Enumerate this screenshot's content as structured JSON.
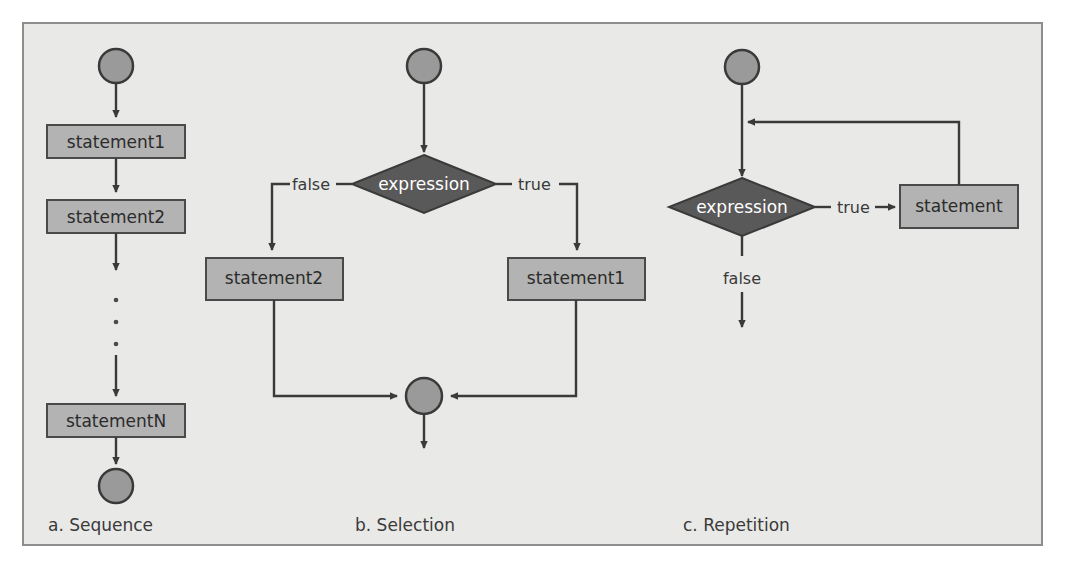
{
  "figure": {
    "background_color": "#e9e9e7",
    "border_color": "#8d8d8d",
    "box_fill": "#b3b3b3",
    "decision_fill": "#595959",
    "circle_fill": "#9a9a9a",
    "line_color": "#3a3a3a",
    "text_color": "#2b2b2b",
    "decision_text_color": "#ffffff"
  },
  "panels": [
    {
      "id": "sequence",
      "caption": "a.  Sequence",
      "nodes": {
        "start": "start-node",
        "statement1": "statement1",
        "statement2": "statement2",
        "ellipsis": "⋮",
        "statementN": "statementN",
        "end": "end-node"
      }
    },
    {
      "id": "selection",
      "caption": "b.  Selection",
      "nodes": {
        "start": "start-node",
        "decision": "expression",
        "false_label": "false",
        "true_label": "true",
        "false_branch": "statement2",
        "true_branch": "statement1",
        "merge": "merge-node"
      }
    },
    {
      "id": "repetition",
      "caption": "c.  Repetition",
      "nodes": {
        "start": "start-node",
        "decision": "expression",
        "true_label": "true",
        "false_label": "false",
        "body": "statement"
      }
    }
  ],
  "labels": {
    "statement1": "statement1",
    "statement2": "statement2",
    "statementN": "statementN",
    "statement": "statement",
    "expression": "expression",
    "true": "true",
    "false": "false",
    "caption_a": "a.  Sequence",
    "caption_b": "b.  Selection",
    "caption_c": "c.  Repetition"
  }
}
